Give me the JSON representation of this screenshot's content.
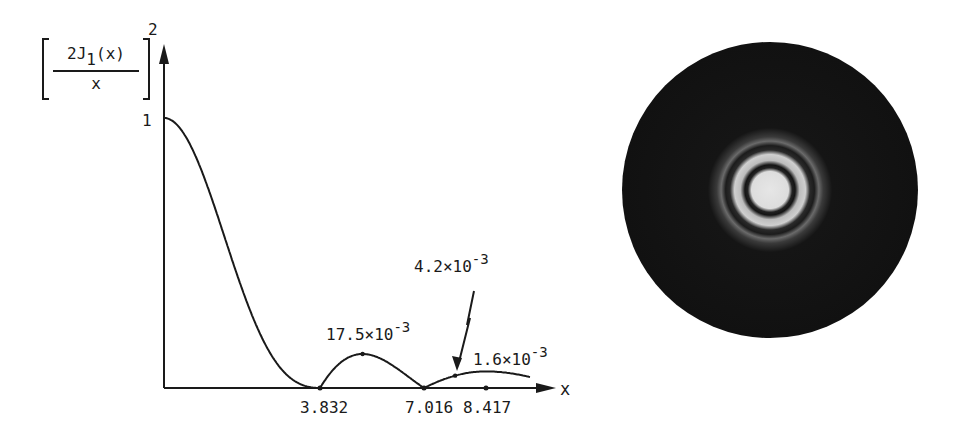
{
  "chart_data": {
    "type": "line",
    "title": "",
    "xlabel": "x",
    "ylabel": {
      "numerator": "2J",
      "subscript": "1",
      "numerator_tail": "(x)",
      "denominator": "x",
      "exponent": "2",
      "full": "[2J1(x)/x]^2"
    },
    "y_tick_labels": [
      "1"
    ],
    "y_ticks": [
      1
    ],
    "xlim": [
      0,
      9.3
    ],
    "ylim": [
      0,
      1
    ],
    "x_zero_labels": [
      "3.832",
      "7.016",
      "8.417"
    ],
    "zeros": [
      3.832,
      7.016,
      8.417
    ],
    "annotations": [
      {
        "text_base": "17.5×10",
        "text_exp": "-3",
        "value": 0.0175,
        "at_x": 5.136
      },
      {
        "text_base": "4.2×10",
        "text_exp": "-3",
        "value": 0.0042,
        "at_x": 8.417,
        "arrow": true
      },
      {
        "text_base": "1.6×10",
        "text_exp": "-3",
        "value": 0.0016,
        "at_x": 9.9
      }
    ],
    "series": [
      {
        "name": "Airy intensity pattern",
        "function": "[2J1(x)/x]^2",
        "x_range": [
          0,
          9.3
        ]
      }
    ],
    "grid": false,
    "legend": "none"
  },
  "side_image": {
    "description": "Airy diffraction pattern photograph",
    "background": "#111111",
    "center_color": "#e6e6e6",
    "ring_color": "#cfcfcf"
  }
}
